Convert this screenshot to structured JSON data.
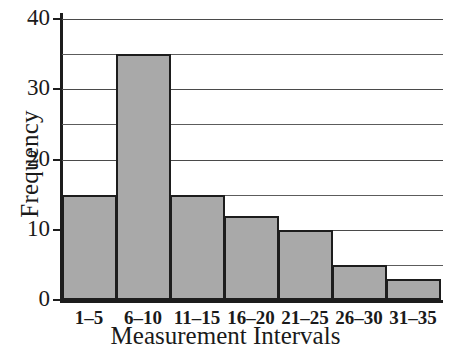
{
  "chart_data": {
    "type": "bar",
    "title": "",
    "xlabel": "Measurement Intervals",
    "ylabel": "Frequency",
    "categories": [
      "1–5",
      "6–10",
      "11–15",
      "16–20",
      "21–25",
      "26–30",
      "31–35"
    ],
    "values": [
      15,
      35,
      15,
      12,
      10,
      5,
      3
    ],
    "ylim": [
      0,
      40
    ],
    "ytick_labels": [
      "0",
      "10",
      "20",
      "30",
      "40"
    ],
    "ytick_values": [
      0,
      10,
      20,
      30,
      40
    ],
    "gridline_values": [
      5,
      10,
      15,
      20,
      25,
      30,
      35,
      40
    ],
    "grid": true,
    "legend": "none",
    "bar_fill_color": "#a9a9a9",
    "bar_edge_color": "#1d1d1d",
    "axis_color": "#1d1d1d",
    "grid_color": "#5c5c5c"
  }
}
